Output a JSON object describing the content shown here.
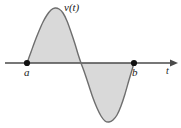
{
  "figure": {
    "kind": "math-plot",
    "background_color": "#ffffff",
    "labels": {
      "function_label": "v(t)",
      "left_bound_label": "a",
      "right_bound_label": "b",
      "axis_label": "t"
    },
    "colors": {
      "fill": "#d9d9d9",
      "curve_stroke": "#6e6e6e",
      "axis_stroke": "#4a4a4a",
      "point_fill": "#111111",
      "text": "#1a1a1a"
    }
  },
  "chart_data": {
    "type": "area",
    "title": "",
    "subtitle": "",
    "xlabel": "t",
    "ylabel": "v(t)",
    "legend": [],
    "grid": false,
    "axis": {
      "x_axis_y_pixel": 63,
      "x_start_pixel": 5,
      "x_end_pixel": 178,
      "arrowhead": "right",
      "y_axis_shown": false,
      "tick_labels": [
        "a",
        "b"
      ]
    },
    "xlim": [
      5,
      178
    ],
    "ylim": [
      128,
      0
    ],
    "annotations": [
      {
        "text": "v(t)",
        "x": 70,
        "y": 8,
        "style": "italic"
      },
      {
        "text": "a",
        "x": 28,
        "y": 73,
        "style": "italic"
      },
      {
        "text": "b",
        "x": 136,
        "y": 73,
        "style": "italic"
      },
      {
        "text": "t",
        "x": 168,
        "y": 72,
        "style": "italic"
      }
    ],
    "markers": [
      {
        "name": "a",
        "x": 27,
        "y": 63
      },
      {
        "name": "b",
        "x": 134,
        "y": 63
      }
    ],
    "series": [
      {
        "name": "v(t)",
        "description": "one full sine period from t=a to t=b, positive lobe first then negative lobe, region between curve and t-axis shaded",
        "fill": true,
        "points": [
          [
            27,
            63
          ],
          [
            31,
            52
          ],
          [
            35,
            41
          ],
          [
            39,
            31
          ],
          [
            43,
            22
          ],
          [
            47,
            15
          ],
          [
            51,
            10
          ],
          [
            55,
            8
          ],
          [
            59,
            9
          ],
          [
            63,
            13
          ],
          [
            67,
            21
          ],
          [
            71,
            32
          ],
          [
            75,
            44
          ],
          [
            78,
            54
          ],
          [
            81,
            63
          ],
          [
            85,
            74
          ],
          [
            89,
            86
          ],
          [
            93,
            98
          ],
          [
            97,
            108
          ],
          [
            101,
            116
          ],
          [
            105,
            121
          ],
          [
            109,
            122
          ],
          [
            113,
            120
          ],
          [
            117,
            115
          ],
          [
            121,
            106
          ],
          [
            125,
            94
          ],
          [
            129,
            80
          ],
          [
            132,
            70
          ],
          [
            134,
            63
          ]
        ]
      }
    ],
    "zero_crossings": [
      27,
      81,
      134
    ],
    "peak": {
      "x": 55,
      "y": 8
    },
    "trough": {
      "x": 109,
      "y": 122
    }
  }
}
